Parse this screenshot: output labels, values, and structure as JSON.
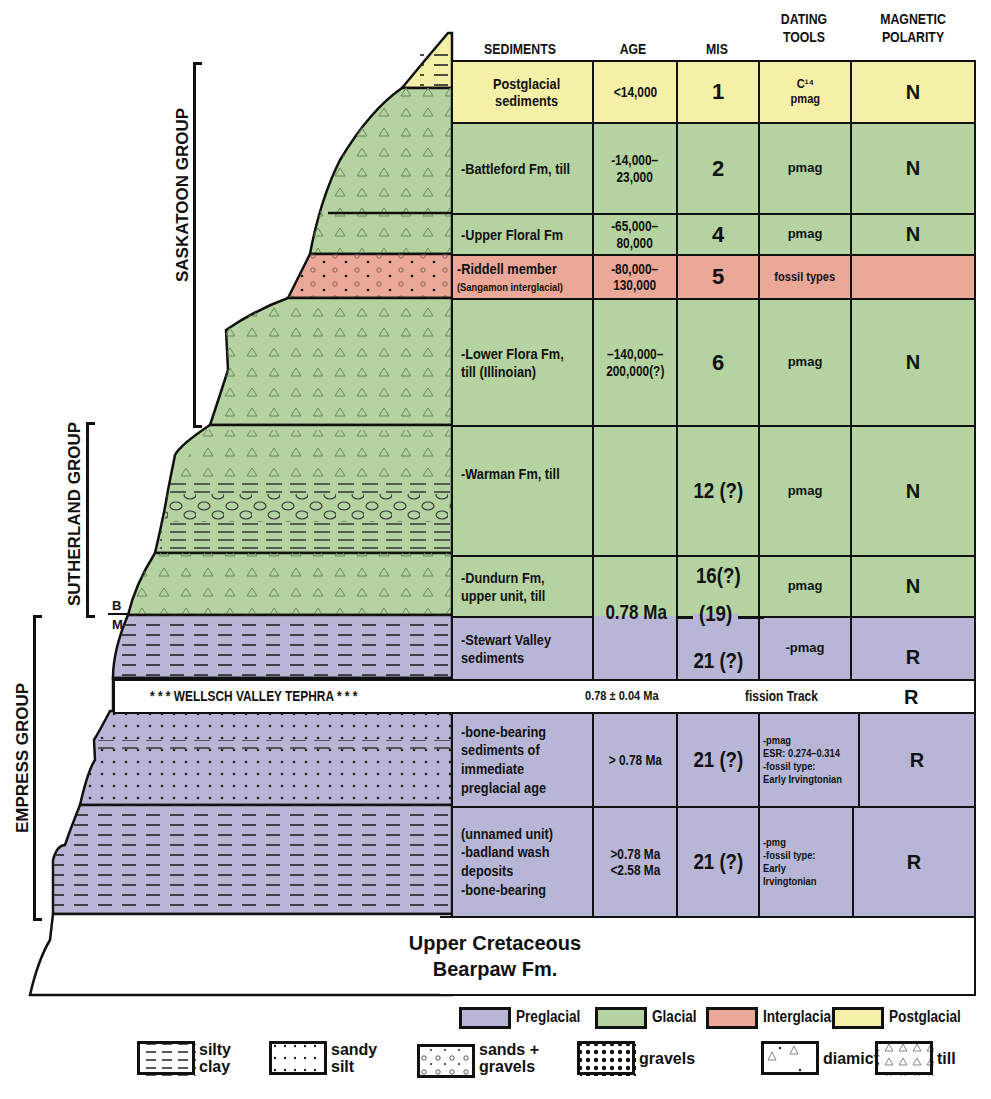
{
  "headers": {
    "sediments": "SEDIMENTS",
    "age": "AGE",
    "mis": "MIS",
    "dating_tools": [
      "DATING",
      "TOOLS"
    ],
    "magnetic_polarity": [
      "MAGNETIC",
      "POLARITY"
    ]
  },
  "groups": {
    "saskatoon": "SASKATOON GROUP",
    "sutherland": "SUTHERLAND GROUP",
    "empress": "EMPRESS GROUP"
  },
  "boundary_labels": {
    "b": "B",
    "m": "M"
  },
  "rows": [
    {
      "sediments": [
        "Postglacial",
        "sediments"
      ],
      "age": "<14,000",
      "mis": "1",
      "dating": [
        "C¹⁴",
        "pmag"
      ],
      "polarity": "N",
      "period": "postglacial"
    },
    {
      "sediments": [
        "-Battleford Fm, till"
      ],
      "age": [
        "-14,000–",
        "23,000"
      ],
      "mis": "2",
      "dating": [
        "pmag"
      ],
      "polarity": "N",
      "period": "glacial"
    },
    {
      "sediments": [
        "-Upper Floral Fm"
      ],
      "age": [
        "-65,000–",
        "80,000"
      ],
      "mis": "4",
      "dating": [
        "pmag"
      ],
      "polarity": "N",
      "period": "glacial"
    },
    {
      "sediments": [
        "-Riddell member",
        "(Sangamon interglacial)"
      ],
      "age": [
        "-80,000–",
        "130,000"
      ],
      "mis": "5",
      "dating": [
        "fossil types"
      ],
      "polarity": "",
      "period": "interglacial"
    },
    {
      "sediments": [
        "-Lower Flora Fm,",
        "till (Illinoian)"
      ],
      "age": [
        "–140,000–",
        "200,000(?)"
      ],
      "mis": "6",
      "dating": [
        "pmag"
      ],
      "polarity": "N",
      "period": "glacial"
    },
    {
      "sediments": [
        "-Warman Fm, till"
      ],
      "age": "",
      "mis": "12 (?)",
      "dating": [
        "pmag"
      ],
      "polarity": "N",
      "period": "glacial"
    },
    {
      "sediments": [
        "-Dundurn Fm,",
        "upper unit, till"
      ],
      "age": "",
      "mis": "16(?)",
      "dating": [
        "pmag"
      ],
      "polarity": "N",
      "period": "glacial"
    },
    {
      "sediments": [
        "-Stewart Valley",
        "sediments"
      ],
      "age": "",
      "mis": "21 (?)",
      "dating": [
        "-pmag"
      ],
      "polarity": "R",
      "period": "preglacial"
    },
    {
      "sediments": [
        "-bone-bearing",
        "sediments of",
        "immediate",
        "preglacial age"
      ],
      "age": "> 0.78 Ma",
      "mis": "21 (?)",
      "dating": [
        "-pmag",
        "ESR: 0.274–0.314",
        "-fossil type:",
        "Early Irvingtonian"
      ],
      "polarity": "R",
      "period": "preglacial"
    },
    {
      "sediments": [
        "(unnamed unit)",
        "-badland wash",
        "deposits",
        "-bone-bearing"
      ],
      "age": [
        ">0.78 Ma",
        "<2.58 Ma"
      ],
      "mis": "21 (?)",
      "dating": [
        "-pmg",
        "-fossil type:",
        "Early Irvingtonian"
      ],
      "polarity": "R",
      "period": "preglacial"
    }
  ],
  "boundary": {
    "age": "0.78 Ma",
    "mis": "(19)"
  },
  "tephra": {
    "label": "* * * WELLSCH VALLEY TEPHRA * * *",
    "age": "0.78 ± 0.04 Ma",
    "dating": "fission Track",
    "polarity": "R"
  },
  "bedrock": [
    "Upper Cretaceous",
    "Bearpaw Fm."
  ],
  "legend": {
    "periods": [
      {
        "label": "Preglacial",
        "color": "#b8b6d6"
      },
      {
        "label": "Glacial",
        "color": "#b5d3a0"
      },
      {
        "label": "Interglacial",
        "color": "#eba898"
      },
      {
        "label": "Postglacial",
        "color": "#f5f0a8"
      }
    ],
    "lithology": [
      {
        "label": [
          "silty",
          "clay"
        ],
        "pattern": "silty-clay"
      },
      {
        "label": [
          "sandy",
          "silt"
        ],
        "pattern": "sandy-silt"
      },
      {
        "label": [
          "sands +",
          "gravels"
        ],
        "pattern": "sands-gravels"
      },
      {
        "label": [
          "gravels"
        ],
        "pattern": "gravels"
      },
      {
        "label": [
          "diamict"
        ],
        "pattern": "diamict"
      },
      {
        "label": [
          "till"
        ],
        "pattern": "till"
      }
    ]
  }
}
